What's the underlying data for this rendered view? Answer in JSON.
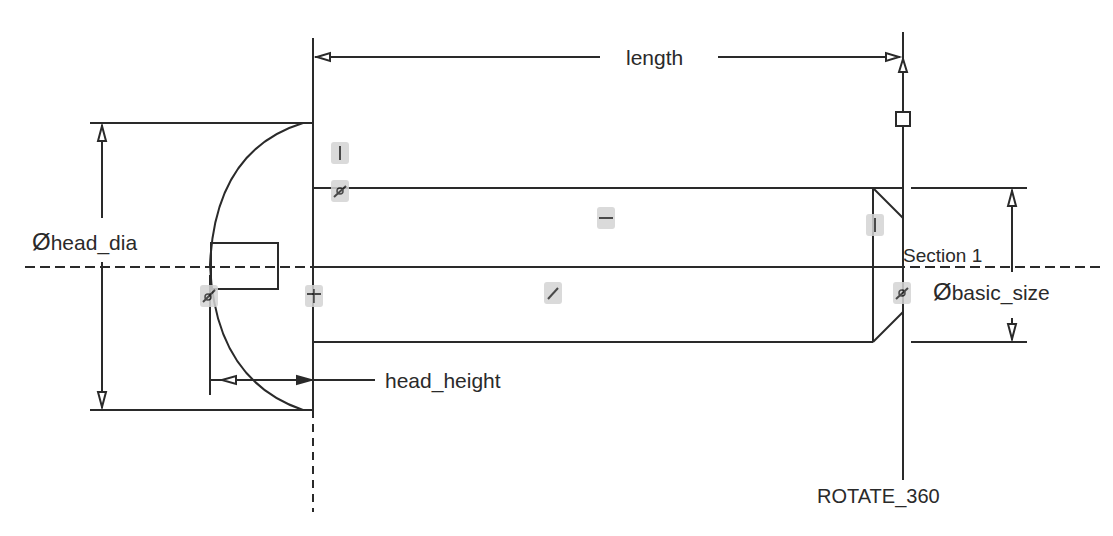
{
  "sketch": {
    "colors": {
      "line": "#2a2a2a",
      "background": "#ffffff",
      "constraint_highlight": "#d4d4d4"
    },
    "dimensions": {
      "length": {
        "label": "length"
      },
      "head_dia": {
        "symbol": "Ø",
        "label": "head_dia"
      },
      "head_height": {
        "label": "head_height"
      },
      "basic_size": {
        "symbol": "Ø",
        "label": "basic_size"
      }
    },
    "annotations": {
      "section": "Section 1",
      "rotate": "ROTATE_360"
    },
    "constraints": [
      {
        "type": "vertical",
        "glyph": "|"
      },
      {
        "type": "tangent",
        "glyph": "⌀"
      },
      {
        "type": "horizontal",
        "glyph": "—"
      },
      {
        "type": "tangent",
        "glyph": "/"
      },
      {
        "type": "vertical",
        "glyph": "|"
      },
      {
        "type": "parallel",
        "glyph": "="
      },
      {
        "type": "tangent",
        "glyph": "⌀"
      },
      {
        "type": "tangent",
        "glyph": "⌀"
      }
    ]
  }
}
